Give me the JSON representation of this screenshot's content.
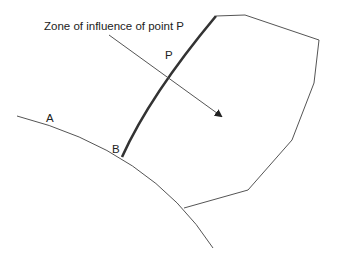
{
  "diagram": {
    "caption": "Zone of influence of point P",
    "labels": {
      "a": "A",
      "b": "B",
      "p": "P"
    },
    "colors": {
      "line": "#555555",
      "thick_line": "#333333",
      "text": "#222222",
      "background": "#ffffff"
    }
  }
}
